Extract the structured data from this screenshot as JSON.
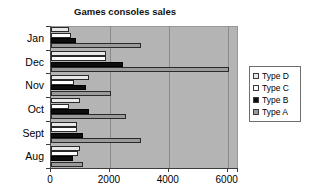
{
  "chart_data": {
    "type": "bar",
    "orientation": "horizontal",
    "title": "Games consoles sales",
    "xlabel": "",
    "ylabel": "",
    "categories": [
      "Jan",
      "Dec",
      "Nov",
      "Oct",
      "Sept",
      "Aug"
    ],
    "series": [
      {
        "name": "Type D",
        "color": "#e8e8e8",
        "values": [
          620,
          1870,
          1300,
          1000,
          880,
          1000
        ]
      },
      {
        "name": "Type C",
        "color": "#ffffff",
        "values": [
          680,
          1870,
          780,
          600,
          880,
          900
        ]
      },
      {
        "name": "Type B",
        "color": "#0d0d0d",
        "values": [
          850,
          2440,
          1200,
          1300,
          1080,
          750
        ]
      },
      {
        "name": "Type A",
        "color": "#9a9a9a",
        "values": [
          3050,
          6050,
          2050,
          2540,
          3050,
          1080
        ]
      }
    ],
    "xlim": [
      0,
      6350
    ],
    "xticks": [
      0,
      2000,
      4000,
      6000
    ],
    "xtick_labels": [
      "0",
      "2000",
      "4000",
      "6000"
    ],
    "gridlines": [
      2000,
      4000,
      6000
    ],
    "grid": true,
    "legend_position": "right",
    "plot_background": "#b4b4b4"
  }
}
